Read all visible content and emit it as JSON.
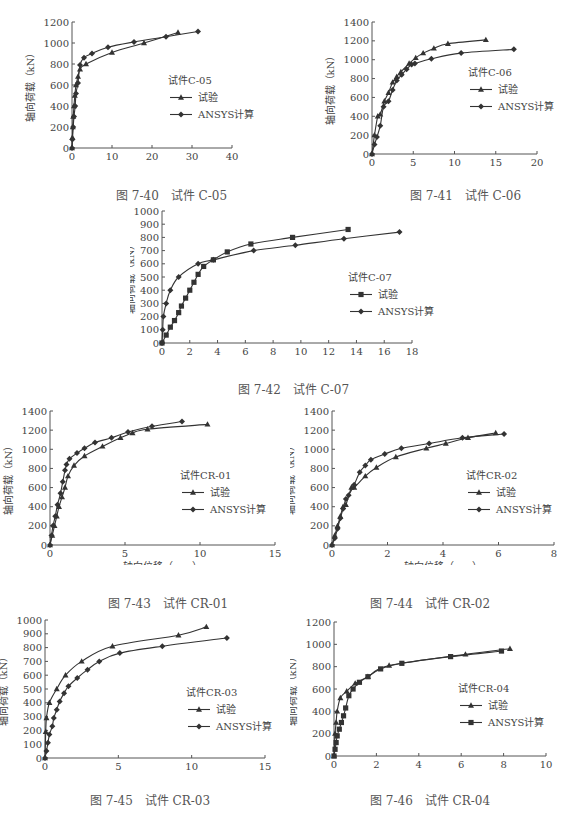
{
  "page": {
    "figures": [
      {
        "id": "fig740",
        "caption": "图 7-40　试件 C-05"
      },
      {
        "id": "fig741",
        "caption": "图 7-41　试件 C-06"
      },
      {
        "id": "fig742",
        "caption": "图 7-42　试件 C-07"
      },
      {
        "id": "fig743",
        "caption": "图 7-43　试件 CR-01"
      },
      {
        "id": "fig744",
        "caption": "图 7-44　试件 CR-02"
      },
      {
        "id": "fig745",
        "caption": "图 7-45　试件 CR-03"
      },
      {
        "id": "fig746",
        "caption": "图 7-46　试件 CR-04"
      }
    ]
  },
  "chart_data": [
    {
      "type": "line",
      "title": "试件C-05",
      "caption": "图 7-40 试件 C-05",
      "xlabel": "轴向位移（mm）",
      "ylabel": "轴向荷载（kN）",
      "xlim": [
        0,
        40
      ],
      "ylim": [
        0,
        1200
      ],
      "xticks": [
        0,
        10,
        20,
        30,
        40
      ],
      "yticks": [
        0,
        200,
        400,
        600,
        800,
        1000,
        1200
      ],
      "legend_title": "试件C-05",
      "series": [
        {
          "name": "试验",
          "marker": "triangle",
          "x": [
            0,
            0.1,
            0.2,
            0.3,
            0.5,
            0.7,
            1.0,
            1.5,
            2.0,
            3.5,
            10,
            18,
            26.5
          ],
          "y": [
            0,
            100,
            200,
            300,
            400,
            500,
            600,
            680,
            750,
            800,
            910,
            1000,
            1100
          ]
        },
        {
          "name": "ANSYS计算",
          "marker": "diamond",
          "x": [
            0,
            0.1,
            0.3,
            0.5,
            0.8,
            1.0,
            1.5,
            2.0,
            3.0,
            5.0,
            9.0,
            15.5,
            23.5,
            31.5
          ],
          "y": [
            0,
            80,
            200,
            300,
            400,
            520,
            620,
            790,
            860,
            900,
            960,
            1010,
            1060,
            1110
          ]
        }
      ]
    },
    {
      "type": "line",
      "title": "试件C-06",
      "caption": "图 7-41 试件 C-06",
      "xlabel": "轴向位移（mm）",
      "ylabel": "轴向荷载（kN）",
      "xlim": [
        0,
        20
      ],
      "ylim": [
        0,
        1400
      ],
      "xticks": [
        0,
        5,
        10,
        15,
        20
      ],
      "yticks": [
        0,
        200,
        400,
        600,
        800,
        1000,
        1200,
        1400
      ],
      "legend_title": "试件C-06",
      "series": [
        {
          "name": "试验",
          "marker": "triangle",
          "x": [
            0,
            0.3,
            0.7,
            1.0,
            1.5,
            2.0,
            2.5,
            3.0,
            3.5,
            4.5,
            5.3,
            6.2,
            7.5,
            9.2,
            13.8
          ],
          "y": [
            0,
            200,
            400,
            420,
            560,
            650,
            760,
            820,
            870,
            960,
            1020,
            1070,
            1120,
            1170,
            1210
          ]
        },
        {
          "name": "ANSYS计算",
          "marker": "diamond",
          "x": [
            0,
            0.3,
            0.6,
            1.0,
            1.4,
            2.0,
            2.5,
            3.0,
            3.6,
            4.2,
            4.8,
            5.2,
            7.2,
            10.8,
            17.2
          ],
          "y": [
            0,
            100,
            180,
            300,
            500,
            560,
            680,
            780,
            840,
            900,
            950,
            960,
            1010,
            1070,
            1110
          ]
        }
      ]
    },
    {
      "type": "line",
      "title": "试件C-07",
      "caption": "图 7-42 试件 C-07",
      "xlabel": "轴向位移（mm）",
      "ylabel": "轴向荷载（kN）",
      "xlim": [
        0,
        18
      ],
      "ylim": [
        0,
        1000
      ],
      "xticks": [
        0,
        2,
        4,
        6,
        8,
        10,
        12,
        14,
        16,
        18
      ],
      "yticks": [
        0,
        100,
        200,
        300,
        400,
        500,
        600,
        700,
        800,
        900,
        1000
      ],
      "legend_title": "试件C-07",
      "series": [
        {
          "name": "试验",
          "marker": "square",
          "x": [
            0,
            0.3,
            0.6,
            0.9,
            1.2,
            1.4,
            1.7,
            2.0,
            2.3,
            2.6,
            3.0,
            3.7,
            4.7,
            6.4,
            9.4,
            13.4
          ],
          "y": [
            0,
            60,
            120,
            170,
            230,
            280,
            340,
            400,
            460,
            520,
            580,
            630,
            690,
            750,
            800,
            860
          ]
        },
        {
          "name": "ANSYS计算",
          "marker": "diamond",
          "x": [
            0,
            0.05,
            0.1,
            0.3,
            0.6,
            1.2,
            2.6,
            3.7,
            6.6,
            9.6,
            13.1,
            17.1
          ],
          "y": [
            0,
            100,
            200,
            300,
            400,
            500,
            600,
            630,
            700,
            740,
            790,
            840
          ]
        }
      ]
    },
    {
      "type": "line",
      "title": "试件CR-01",
      "caption": "图 7-43 试件 CR-01",
      "xlabel": "轴向位移（mm）",
      "ylabel": "轴向荷载（kN）",
      "xlim": [
        0,
        15
      ],
      "ylim": [
        0,
        1400
      ],
      "xticks": [
        0,
        5,
        10,
        15
      ],
      "yticks": [
        0,
        200,
        400,
        600,
        800,
        1000,
        1200,
        1400
      ],
      "legend_title": "试件CR-01",
      "series": [
        {
          "name": "试验",
          "marker": "triangle",
          "x": [
            0,
            0.15,
            0.3,
            0.45,
            0.6,
            0.8,
            1.0,
            1.2,
            1.6,
            2.3,
            3.5,
            4.7,
            5.5,
            6.5,
            10.5
          ],
          "y": [
            0,
            100,
            200,
            300,
            400,
            500,
            600,
            720,
            830,
            930,
            1030,
            1120,
            1170,
            1210,
            1260
          ]
        },
        {
          "name": "ANSYS计算",
          "marker": "diamond",
          "x": [
            0,
            0.1,
            0.2,
            0.35,
            0.5,
            0.7,
            0.85,
            1.0,
            1.1,
            1.3,
            1.8,
            2.3,
            3.0,
            4.1,
            5.2,
            6.8,
            8.8
          ],
          "y": [
            0,
            100,
            200,
            300,
            420,
            540,
            660,
            780,
            840,
            900,
            960,
            1010,
            1070,
            1120,
            1180,
            1240,
            1290
          ]
        }
      ]
    },
    {
      "type": "line",
      "title": "试件CR-02",
      "caption": "图 7-44 试件 CR-02",
      "xlabel": "轴向位移（mm）",
      "ylabel": "轴向荷载（kN）",
      "xlim": [
        0,
        8
      ],
      "ylim": [
        0,
        1400
      ],
      "xticks": [
        0,
        2,
        4,
        6,
        8
      ],
      "yticks": [
        0,
        200,
        400,
        600,
        800,
        1000,
        1200,
        1400
      ],
      "legend_title": "试件CR-02",
      "series": [
        {
          "name": "试验",
          "marker": "triangle",
          "x": [
            0,
            0.1,
            0.2,
            0.3,
            0.4,
            0.5,
            0.7,
            0.8,
            1.2,
            1.6,
            2.3,
            3.4,
            4.1,
            4.9,
            5.9
          ],
          "y": [
            0,
            100,
            200,
            300,
            400,
            420,
            600,
            600,
            720,
            810,
            920,
            1010,
            1060,
            1120,
            1170
          ]
        },
        {
          "name": "ANSYS计算",
          "marker": "diamond",
          "x": [
            0,
            0.1,
            0.2,
            0.3,
            0.4,
            0.5,
            0.6,
            0.8,
            1.0,
            1.2,
            1.4,
            1.9,
            2.5,
            3.5,
            4.7,
            6.2
          ],
          "y": [
            0,
            70,
            170,
            280,
            380,
            480,
            520,
            630,
            760,
            830,
            890,
            950,
            1010,
            1060,
            1120,
            1160
          ]
        }
      ]
    },
    {
      "type": "line",
      "title": "试件CR-03",
      "caption": "图 7-45 试件 CR-03",
      "xlabel": "轴向位移（mm）",
      "ylabel": "轴向荷载（kN）",
      "xlim": [
        0,
        15
      ],
      "ylim": [
        0,
        1000
      ],
      "xticks": [
        0,
        5,
        10,
        15
      ],
      "yticks": [
        0,
        100,
        200,
        300,
        400,
        500,
        600,
        700,
        800,
        900,
        1000
      ],
      "legend_title": "试件CR-03",
      "series": [
        {
          "name": "试验",
          "marker": "triangle",
          "x": [
            0,
            0.05,
            0.1,
            0.3,
            0.8,
            1.4,
            2.5,
            4.6,
            9.1,
            11.0
          ],
          "y": [
            0,
            190,
            290,
            400,
            500,
            600,
            700,
            810,
            890,
            950
          ]
        },
        {
          "name": "ANSYS计算",
          "marker": "diamond",
          "x": [
            0,
            0.1,
            0.2,
            0.3,
            0.5,
            0.6,
            0.8,
            1.0,
            1.3,
            1.6,
            2.2,
            2.9,
            3.7,
            5.1,
            8.0,
            12.4
          ],
          "y": [
            0,
            50,
            110,
            170,
            230,
            290,
            350,
            410,
            470,
            520,
            580,
            640,
            700,
            760,
            810,
            870,
            930
          ]
        }
      ]
    },
    {
      "type": "line",
      "title": "试件CR-04",
      "caption": "图 7-46 试件 CR-04",
      "xlabel": "轴向位移（mm）",
      "ylabel": "轴向荷载（kN）",
      "xlim": [
        0,
        10
      ],
      "ylim": [
        0,
        1200
      ],
      "xticks": [
        0,
        2,
        4,
        6,
        8,
        10
      ],
      "yticks": [
        0,
        200,
        400,
        600,
        800,
        1000,
        1200
      ],
      "legend_title": "试件CR-04",
      "series": [
        {
          "name": "试验",
          "marker": "triangle",
          "x": [
            0,
            0.05,
            0.1,
            0.15,
            0.3,
            0.6,
            1.0,
            1.6,
            2.6,
            6.2,
            8.3
          ],
          "y": [
            0,
            200,
            300,
            400,
            520,
            580,
            650,
            710,
            810,
            910,
            960
          ]
        },
        {
          "name": "ANSYS计算",
          "marker": "square",
          "x": [
            0,
            0.05,
            0.1,
            0.15,
            0.25,
            0.35,
            0.45,
            0.55,
            0.7,
            0.9,
            1.2,
            1.6,
            2.2,
            3.2,
            5.5,
            7.9
          ],
          "y": [
            0,
            60,
            120,
            180,
            240,
            300,
            360,
            430,
            540,
            600,
            660,
            710,
            780,
            830,
            890,
            940,
            1000
          ]
        }
      ]
    }
  ]
}
